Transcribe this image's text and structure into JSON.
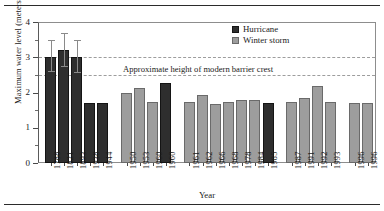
{
  "figure": {
    "top_rule": true,
    "bottom_rule": true
  },
  "chart_data": {
    "type": "bar",
    "title": "",
    "xlabel": "Year",
    "ylabel": "Maximum water level (meters)",
    "ylim": [
      0,
      4
    ],
    "y_ticks": [
      0,
      1,
      2,
      3,
      4
    ],
    "y_tick_labels": [
      "0",
      "1",
      "2",
      "3",
      "4"
    ],
    "y_minor_ticks": [
      0.5,
      1.5,
      2.5,
      3.5
    ],
    "grid": false,
    "legend_position": "top-right",
    "legend": [
      {
        "name": "Hurricane",
        "color": "#2e2e2e"
      },
      {
        "name": "Winter storm",
        "color": "#9d9d9d"
      }
    ],
    "reference_lines": [
      {
        "value": 3.0,
        "style": "dashed",
        "color": "#9d9d9d"
      },
      {
        "value": 2.5,
        "style": "dashed",
        "color": "#9d9d9d"
      }
    ],
    "annotations": [
      {
        "text": "Approximate height of modern barrier crest",
        "value": 2.55
      }
    ],
    "categories": [
      "1788",
      "1821",
      "1893",
      "1938",
      "1944",
      "1950",
      "1953",
      "1960",
      "1960",
      "1961",
      "1962",
      "1966",
      "1968",
      "1978",
      "1984",
      "1985",
      "1987",
      "1991",
      "1992",
      "1993",
      "1996",
      "1996"
    ],
    "values": [
      3.0,
      3.22,
      3.0,
      1.7,
      1.7,
      2.0,
      2.12,
      1.74,
      2.27,
      1.74,
      1.93,
      1.67,
      1.73,
      1.79,
      1.79,
      1.7,
      1.74,
      1.85,
      2.19,
      1.74,
      1.7,
      1.7
    ],
    "types": [
      "Hurricane",
      "Hurricane",
      "Hurricane",
      "Hurricane",
      "Hurricane",
      "Winter storm",
      "Winter storm",
      "Winter storm",
      "Hurricane",
      "Winter storm",
      "Winter storm",
      "Winter storm",
      "Winter storm",
      "Winter storm",
      "Winter storm",
      "Hurricane",
      "Winter storm",
      "Winter storm",
      "Winter storm",
      "Winter storm",
      "Winter storm",
      "Winter storm"
    ],
    "error_bars": [
      {
        "index": 0,
        "low": 2.62,
        "high": 3.5
      },
      {
        "index": 1,
        "low": 2.76,
        "high": 3.68
      },
      {
        "index": 2,
        "low": 2.58,
        "high": 3.5
      }
    ],
    "group_breaks_after": [
      4,
      8,
      15,
      19
    ]
  }
}
